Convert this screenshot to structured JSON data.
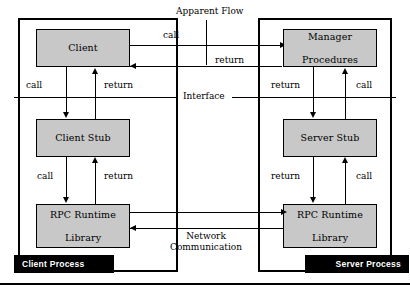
{
  "diagram": {
    "colors": {
      "box_fill": "#c8c8c8",
      "stroke": "#000000",
      "banner_bg": "#000000",
      "banner_text": "#ffffff",
      "background": "#ffffff"
    },
    "processes": [
      {
        "id": "client-process",
        "banner_label": "Client Process"
      },
      {
        "id": "server-process",
        "banner_label": "Server Process"
      }
    ],
    "components": {
      "client": {
        "line1": "Client",
        "line2": ""
      },
      "client_stub": {
        "line1": "Client Stub",
        "line2": ""
      },
      "client_runtime": {
        "line1": "RPC Runtime",
        "line2": "Library"
      },
      "manager_procedures": {
        "line1": "Manager",
        "line2": "Procedures"
      },
      "server_stub": {
        "line1": "Server Stub",
        "line2": ""
      },
      "server_runtime": {
        "line1": "RPC Runtime",
        "line2": "Library"
      }
    },
    "annotations": {
      "apparent_flow": "Apparent Flow",
      "interface": "Interface",
      "network_line1": "Network",
      "network_line2": "Communication"
    },
    "edge_labels": {
      "apparent_call": "call",
      "apparent_return": "return",
      "client_down": "call",
      "client_up": "return",
      "client_stub_down": "call",
      "client_stub_up": "return",
      "manager_down": "return",
      "manager_up": "call",
      "server_stub_down": "return",
      "server_stub_up": "call"
    }
  }
}
